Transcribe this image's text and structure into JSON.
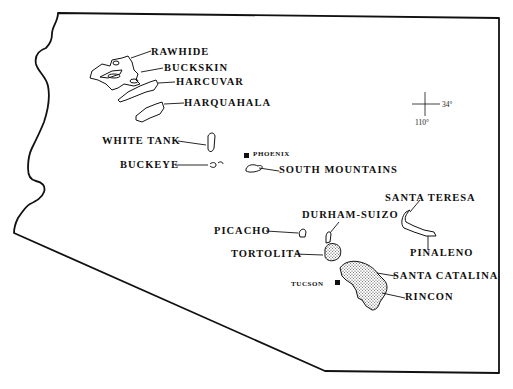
{
  "map": {
    "region": "Arizona",
    "style": "black-and-white outline",
    "colors": {
      "ink": "#111111",
      "background": "#ffffff"
    },
    "reference_mark": {
      "latitude_label": "34°",
      "longitude_label": "110°"
    },
    "cities": [
      {
        "name": "PHOENIX",
        "symbol": "filled-square"
      },
      {
        "name": "TUCSON",
        "symbol": "filled-square"
      }
    ],
    "ranges": [
      {
        "name": "RAWHIDE",
        "shaded": false
      },
      {
        "name": "BUCKSKIN",
        "shaded": false
      },
      {
        "name": "HARCUVAR",
        "shaded": false
      },
      {
        "name": "HARQUAHALA",
        "shaded": false
      },
      {
        "name": "WHITE TANK",
        "shaded": false
      },
      {
        "name": "BUCKEYE",
        "shaded": false
      },
      {
        "name": "SOUTH MOUNTAINS",
        "shaded": false
      },
      {
        "name": "PICACHO",
        "shaded": false
      },
      {
        "name": "DURHAM-SUIZO",
        "shaded": false
      },
      {
        "name": "TORTOLITA",
        "shaded": true
      },
      {
        "name": "SANTA TERESA",
        "shaded": false
      },
      {
        "name": "PINALENO",
        "shaded": false
      },
      {
        "name": "SANTA CATALINA",
        "shaded": true
      },
      {
        "name": "RINCON",
        "shaded": true
      }
    ]
  }
}
